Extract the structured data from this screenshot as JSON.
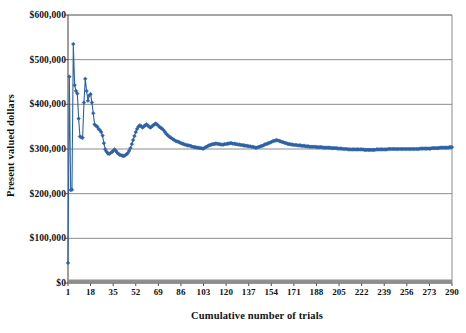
{
  "chart_data": {
    "type": "line",
    "title": "",
    "subtitle": "",
    "xlabel": "Cumulative number of trials",
    "ylabel": "Present valued dollars",
    "xlim": [
      1,
      290
    ],
    "ylim": [
      0,
      600000
    ],
    "grid": true,
    "legend_position": "none",
    "y_tick_labels": [
      "$600,000",
      "$500,000",
      "$400,000",
      "$300,000",
      "$200,000",
      "$100,000",
      "$0"
    ],
    "y_tick_values": [
      600000,
      500000,
      400000,
      300000,
      200000,
      100000,
      0
    ],
    "x_tick_labels": [
      "1",
      "18",
      "35",
      "52",
      "69",
      "86",
      "103",
      "120",
      "137",
      "154",
      "171",
      "188",
      "205",
      "222",
      "239",
      "256",
      "273",
      "290"
    ],
    "x_tick_values": [
      1,
      18,
      35,
      52,
      69,
      86,
      103,
      120,
      137,
      154,
      171,
      188,
      205,
      222,
      239,
      256,
      273,
      290
    ],
    "series": [
      {
        "name": "Present valued dollars (running mean)",
        "color": "#2E62A6",
        "marker": "diamond",
        "values": [
          45000,
          462000,
          208000,
          209000,
          535000,
          443000,
          430000,
          424000,
          368000,
          328000,
          326000,
          325000,
          404000,
          457000,
          430000,
          408000,
          420000,
          423000,
          404000,
          380000,
          355000,
          352000,
          350000,
          345000,
          342000,
          338000,
          330000,
          313000,
          299000,
          294000,
          290000,
          289000,
          291000,
          293000,
          296000,
          299000,
          296000,
          292000,
          289000,
          287000,
          286000,
          285000,
          284000,
          286000,
          288000,
          291000,
          296000,
          302000,
          311000,
          320000,
          329000,
          338000,
          345000,
          350000,
          353000,
          351000,
          348000,
          350000,
          353000,
          355000,
          353000,
          350000,
          348000,
          350000,
          353000,
          355000,
          357000,
          355000,
          352000,
          349000,
          347000,
          345000,
          342000,
          338000,
          334000,
          331000,
          328000,
          326000,
          324000,
          322000,
          320000,
          318000,
          317000,
          316000,
          315000,
          313000,
          312000,
          311000,
          310000,
          309000,
          308000,
          308000,
          307000,
          306000,
          305000,
          304000,
          304000,
          303000,
          303000,
          302000,
          302000,
          301000,
          301000,
          303000,
          305000,
          306000,
          308000,
          309000,
          310000,
          311000,
          311000,
          312000,
          312000,
          311000,
          311000,
          310000,
          310000,
          310000,
          311000,
          311000,
          312000,
          312000,
          313000,
          313000,
          312000,
          312000,
          311000,
          311000,
          310000,
          310000,
          309000,
          309000,
          308000,
          308000,
          307000,
          307000,
          306000,
          306000,
          305000,
          305000,
          304000,
          303000,
          303000,
          304000,
          305000,
          306000,
          307000,
          308000,
          310000,
          311000,
          312000,
          313000,
          314000,
          316000,
          317000,
          318000,
          319000,
          320000,
          319000,
          318000,
          317000,
          316000,
          315000,
          314000,
          313000,
          312000,
          311000,
          311000,
          310000,
          310000,
          309000,
          309000,
          309000,
          308000,
          308000,
          308000,
          307000,
          307000,
          307000,
          306000,
          306000,
          306000,
          305000,
          305000,
          305000,
          305000,
          305000,
          304000,
          304000,
          304000,
          304000,
          304000,
          303000,
          303000,
          303000,
          303000,
          303000,
          303000,
          302000,
          302000,
          302000,
          302000,
          302000,
          301000,
          301000,
          301000,
          301000,
          300000,
          300000,
          300000,
          300000,
          299000,
          299000,
          299000,
          299000,
          299000,
          299000,
          299000,
          299000,
          299000,
          299000,
          299000,
          299000,
          298000,
          298000,
          298000,
          298000,
          298000,
          298000,
          298000,
          298000,
          298000,
          299000,
          299000,
          299000,
          299000,
          299000,
          299000,
          299000,
          299000,
          299000,
          300000,
          300000,
          300000,
          300000,
          300000,
          300000,
          300000,
          300000,
          300000,
          300000,
          300000,
          300000,
          300000,
          300000,
          300000,
          300000,
          300000,
          300000,
          300000,
          300000,
          300000,
          300000,
          300000,
          300000,
          301000,
          301000,
          301000,
          301000,
          301000,
          301000,
          301000,
          301000,
          301000,
          302000,
          302000,
          302000,
          302000,
          302000,
          302000,
          303000,
          303000,
          303000,
          303000,
          303000,
          303000,
          303000,
          304000,
          304000,
          304000
        ]
      },
      {
        "name": "Baseline band",
        "color": "#8a8a8a",
        "marker": "none",
        "constant_value": 0
      }
    ]
  }
}
